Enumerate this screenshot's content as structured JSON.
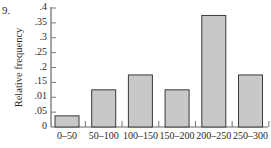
{
  "problem_number": "9.",
  "chart_data": {
    "type": "bar",
    "title": "",
    "xlabel": "",
    "ylabel": "Relative frequency",
    "categories": [
      "0–50",
      "50–100",
      "100–150",
      "150–200",
      "200–250",
      "250–300"
    ],
    "values": [
      0.0375,
      0.125,
      0.175,
      0.125,
      0.375,
      0.175
    ],
    "ylim": [
      0,
      0.4
    ],
    "y_ticks": [
      0,
      0.05,
      0.1,
      0.15,
      0.2,
      0.25,
      0.3,
      0.35,
      0.4
    ],
    "y_tick_labels": [
      "0",
      ".05",
      ".01",
      ".15",
      ".2",
      ".25",
      ".3",
      ".35",
      ".4"
    ],
    "grid": false,
    "bar_color": "#c8c8c8",
    "bar_edge_color": "#3a3a3a"
  }
}
